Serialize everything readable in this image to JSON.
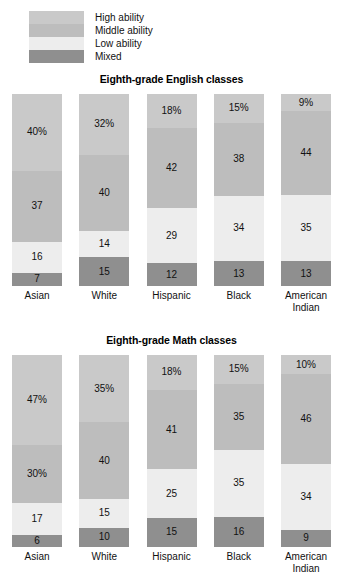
{
  "legend": {
    "items": [
      {
        "label": "High ability",
        "color": "#c9c9c9"
      },
      {
        "label": "Middle ability",
        "color": "#bdbdbd"
      },
      {
        "label": "Low ability",
        "color": "#ededed"
      },
      {
        "label": "Mixed",
        "color": "#8f8f8f"
      }
    ]
  },
  "chart_data": [
    {
      "type": "bar",
      "subtype": "stacked-bar-100",
      "title": "Eighth-grade English classes",
      "xlabel": "",
      "ylabel": "",
      "ylim": [
        0,
        100
      ],
      "grid": false,
      "legend_position": "top-left",
      "stack_order_top_to_bottom": [
        "High ability",
        "Middle ability",
        "Low ability",
        "Mixed"
      ],
      "categories": [
        "Asian",
        "White",
        "Hispanic",
        "Black",
        "American Indian"
      ],
      "series": [
        {
          "name": "High ability",
          "color": "#c9c9c9",
          "values": [
            40,
            32,
            18,
            15,
            9
          ],
          "labels": [
            "40%",
            "32%",
            "18%",
            "15%",
            "9%"
          ]
        },
        {
          "name": "Middle ability",
          "color": "#bdbdbd",
          "values": [
            37,
            40,
            42,
            38,
            44
          ],
          "labels": [
            "37",
            "40",
            "42",
            "38",
            "44"
          ]
        },
        {
          "name": "Low ability",
          "color": "#ededed",
          "values": [
            16,
            14,
            29,
            34,
            35
          ],
          "labels": [
            "16",
            "14",
            "29",
            "34",
            "35"
          ]
        },
        {
          "name": "Mixed",
          "color": "#8f8f8f",
          "values": [
            7,
            15,
            12,
            13,
            13
          ],
          "labels": [
            "7",
            "15",
            "12",
            "13",
            "13"
          ]
        }
      ]
    },
    {
      "type": "bar",
      "subtype": "stacked-bar-100",
      "title": "Eighth-grade Math classes",
      "xlabel": "",
      "ylabel": "",
      "ylim": [
        0,
        100
      ],
      "grid": false,
      "legend_position": "top-left",
      "stack_order_top_to_bottom": [
        "High ability",
        "Middle ability",
        "Low ability",
        "Mixed"
      ],
      "categories": [
        "Asian",
        "White",
        "Hispanic",
        "Black",
        "American Indian"
      ],
      "series": [
        {
          "name": "High ability",
          "color": "#c9c9c9",
          "values": [
            47,
            35,
            18,
            15,
            10
          ],
          "labels": [
            "47%",
            "35%",
            "18%",
            "15%",
            "10%"
          ]
        },
        {
          "name": "Middle ability",
          "color": "#bdbdbd",
          "values": [
            30,
            40,
            41,
            35,
            46
          ],
          "labels": [
            "30%",
            "40",
            "41",
            "35",
            "46"
          ]
        },
        {
          "name": "Low ability",
          "color": "#ededed",
          "values": [
            17,
            15,
            25,
            35,
            34
          ],
          "labels": [
            "17",
            "15",
            "25",
            "35",
            "34"
          ]
        },
        {
          "name": "Mixed",
          "color": "#8f8f8f",
          "values": [
            6,
            10,
            15,
            16,
            9
          ],
          "labels": [
            "6",
            "10",
            "15",
            "16",
            "9"
          ]
        }
      ]
    }
  ]
}
